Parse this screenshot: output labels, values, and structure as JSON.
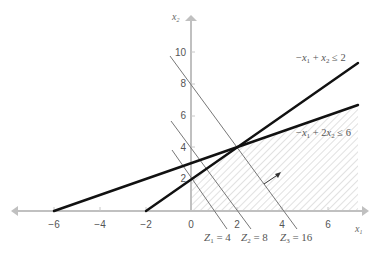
{
  "diagram": {
    "type": "linear-programming-graph",
    "axes": {
      "x_label": "x",
      "x_label_sub": "1",
      "y_label": "x",
      "y_label_sub": "2",
      "x_ticks": [
        "−6",
        "−4",
        "−2",
        "0",
        "2",
        "4",
        "6"
      ],
      "y_ticks": [
        "2",
        "4",
        "6",
        "8",
        "10"
      ],
      "x_range": [
        -7.9,
        7.3
      ],
      "y_range": [
        0,
        11.5
      ]
    },
    "constraints": [
      {
        "id": "c1",
        "expression": "−x1 + x2 ≤ 2",
        "parts": {
          "a": "−",
          "v1": "x",
          "s1": "1",
          "op": " + ",
          "v2": "x",
          "s2": "2",
          "rel": " ≤ 2"
        },
        "line": {
          "x_intercept": -2,
          "y_intercept": 2,
          "slope": 1
        },
        "color": "#111111"
      },
      {
        "id": "c2",
        "expression": "−x1 + 2x2 ≤ 6",
        "parts": {
          "a": "−",
          "v1": "x",
          "s1": "1",
          "op": " + 2",
          "v2": "x",
          "s2": "2",
          "rel": " ≤ 6"
        },
        "line": {
          "x_intercept": -6,
          "y_intercept": 3,
          "slope": 0.5
        },
        "color": "#111111"
      }
    ],
    "objective_lines": [
      {
        "id": "z1",
        "name": "Z",
        "sub": "1",
        "value_text": " = 4",
        "value": 4,
        "x_intercept": 1,
        "y_intercept": 2
      },
      {
        "id": "z2",
        "name": "Z",
        "sub": "2",
        "value_text": " = 8",
        "value": 8,
        "x_intercept": 2,
        "y_intercept": 4
      },
      {
        "id": "z3",
        "name": "Z",
        "sub": "3",
        "value_text": " = 16",
        "value": 16,
        "x_intercept": 4,
        "y_intercept": 8
      }
    ],
    "feasible_region": {
      "style": "hatched",
      "color": "#bbbbbb"
    },
    "intersection_point": {
      "x1": 2,
      "x2": 4
    },
    "colors": {
      "axis": "#bbbbbb",
      "constraint_line": "#111111",
      "objective_line": "#777777",
      "hatch": "#c8c8c8",
      "text": "#555555"
    }
  }
}
